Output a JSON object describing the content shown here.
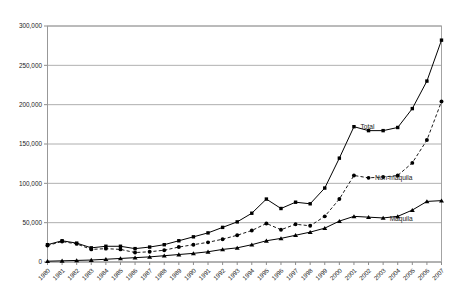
{
  "chart_data": {
    "type": "line",
    "title": "",
    "subtitle": "",
    "xlabel": "",
    "ylabel": "",
    "ylim": [
      0,
      300000
    ],
    "yticks": [
      0,
      50000,
      100000,
      150000,
      200000,
      250000,
      300000
    ],
    "ytick_labels": [
      "0",
      "50,000",
      "100,000",
      "150,000",
      "200,000",
      "250,000",
      "300,000"
    ],
    "grid": true,
    "legend_position": "inline-right-annotations",
    "categories": [
      "1980",
      "1981",
      "1982",
      "1983",
      "1984",
      "1985",
      "1986",
      "1987",
      "1988",
      "1989",
      "1990",
      "1991",
      "1992",
      "1993",
      "1994",
      "1995",
      "1996",
      "1997",
      "1998",
      "1999",
      "2000",
      "2001",
      "2002",
      "2003",
      "2004",
      "2005",
      "2006",
      "2007"
    ],
    "series": [
      {
        "name": "Total",
        "marker": "square",
        "linestyle": "solid",
        "label_year": "2001",
        "values": [
          22000,
          27000,
          24000,
          18000,
          20000,
          20000,
          17000,
          19000,
          22000,
          27000,
          32000,
          37000,
          44000,
          51000,
          62000,
          80000,
          68000,
          76000,
          74000,
          94000,
          132000,
          172000,
          167000,
          167000,
          171000,
          195000,
          230000,
          282000
        ]
      },
      {
        "name": "Non-maquila",
        "marker": "circle",
        "linestyle": "dashed",
        "label_year": "2002",
        "values": [
          21000,
          26000,
          23000,
          16000,
          17000,
          16000,
          12000,
          13000,
          15000,
          19000,
          22000,
          25000,
          29000,
          34000,
          40000,
          49000,
          41000,
          48000,
          46000,
          58000,
          80000,
          110000,
          107000,
          108000,
          110000,
          126000,
          155000,
          204000
        ]
      },
      {
        "name": "Maquila",
        "marker": "triangle",
        "linestyle": "solid",
        "label_year": "2003",
        "values": [
          1000,
          1500,
          2000,
          2500,
          3500,
          4500,
          5500,
          6500,
          8000,
          9500,
          11000,
          13000,
          16000,
          18000,
          22000,
          27000,
          30000,
          34000,
          38000,
          43000,
          52000,
          58000,
          57000,
          56000,
          58000,
          66000,
          77000,
          78000
        ]
      }
    ]
  }
}
